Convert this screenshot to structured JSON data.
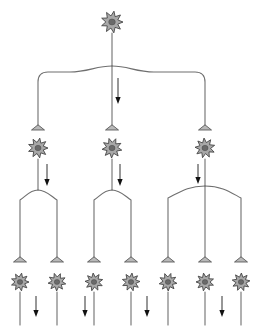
{
  "figure": {
    "background_color": "#ffffff",
    "canvas": {
      "width": 265,
      "height": 327
    }
  },
  "style": {
    "axon_color": "#6f6f6f",
    "soma_fill": "#a8a8a8",
    "soma_outline": "#3d3d3d",
    "nucleus_fill": "#6a6a6a",
    "terminal_fill": "#b9b9b9",
    "terminal_outline": "#4a4a4a",
    "flow_arrow_color": "#111111"
  },
  "layers": [
    {
      "name": "input-layer",
      "level": 1,
      "count": 1,
      "neurons": [
        {
          "id": "n1",
          "label": "input-neuron",
          "cx": 112,
          "cy": 22,
          "r": 11,
          "spikes": 9,
          "outputs": 3
        }
      ]
    },
    {
      "name": "relay-layer",
      "level": 2,
      "count": 3,
      "neurons": [
        {
          "id": "n2a",
          "label": "relay-neuron-left",
          "cx": 38,
          "cy": 148,
          "r": 10,
          "spikes": 9,
          "outputs": 2
        },
        {
          "id": "n2b",
          "label": "relay-neuron-middle",
          "cx": 112,
          "cy": 148,
          "r": 10,
          "spikes": 9,
          "outputs": 2
        },
        {
          "id": "n2c",
          "label": "relay-neuron-right",
          "cx": 205,
          "cy": 148,
          "r": 10,
          "spikes": 9,
          "outputs": 3
        }
      ]
    },
    {
      "name": "output-layer",
      "level": 3,
      "count": 7,
      "neurons": [
        {
          "id": "n3a",
          "label": "output-neuron-1",
          "cx": 20,
          "cy": 282,
          "r": 9,
          "spikes": 9
        },
        {
          "id": "n3b",
          "label": "output-neuron-2",
          "cx": 57,
          "cy": 282,
          "r": 9,
          "spikes": 9
        },
        {
          "id": "n3c",
          "label": "output-neuron-3",
          "cx": 94,
          "cy": 282,
          "r": 9,
          "spikes": 9
        },
        {
          "id": "n3d",
          "label": "output-neuron-4",
          "cx": 131,
          "cy": 282,
          "r": 9,
          "spikes": 9
        },
        {
          "id": "n3e",
          "label": "output-neuron-5",
          "cx": 168,
          "cy": 282,
          "r": 9,
          "spikes": 9
        },
        {
          "id": "n3f",
          "label": "output-neuron-6",
          "cx": 205,
          "cy": 282,
          "r": 9,
          "spikes": 9
        },
        {
          "id": "n3g",
          "label": "output-neuron-7",
          "cx": 241,
          "cy": 282,
          "r": 9,
          "spikes": 9
        }
      ]
    }
  ],
  "terminals": [
    {
      "id": "t2a",
      "label": "synapse-terminal-onto-relay-left",
      "x": 38,
      "y": 130
    },
    {
      "id": "t2b",
      "label": "synapse-terminal-onto-relay-middle",
      "x": 112,
      "y": 130
    },
    {
      "id": "t2c",
      "label": "synapse-terminal-onto-relay-right",
      "x": 205,
      "y": 130
    },
    {
      "id": "t3a",
      "label": "synapse-terminal-onto-output-1",
      "x": 20,
      "y": 262
    },
    {
      "id": "t3b",
      "label": "synapse-terminal-onto-output-2",
      "x": 57,
      "y": 262
    },
    {
      "id": "t3c",
      "label": "synapse-terminal-onto-output-3",
      "x": 94,
      "y": 262
    },
    {
      "id": "t3d",
      "label": "synapse-terminal-onto-output-4",
      "x": 131,
      "y": 262
    },
    {
      "id": "t3e",
      "label": "synapse-terminal-onto-output-5",
      "x": 168,
      "y": 262
    },
    {
      "id": "t3f",
      "label": "synapse-terminal-onto-output-6",
      "x": 205,
      "y": 262
    },
    {
      "id": "t3g",
      "label": "synapse-terminal-onto-output-7",
      "x": 241,
      "y": 262
    }
  ],
  "connections": [
    {
      "id": "c1",
      "label": "input-axon-trunk",
      "from": "n1",
      "to": "branch-1",
      "path": "M112,33 L112,66"
    },
    {
      "id": "c2",
      "label": "input-branch-to-relay-left",
      "from": "branch-1",
      "to": "t2a",
      "path": "M112,66 C 96,66 88,72 70,72 L 48,72 Q 38,72 38,82 L 38,128"
    },
    {
      "id": "c3",
      "label": "input-branch-to-relay-middle",
      "from": "branch-1",
      "to": "t2b",
      "path": "M112,66 L112,128"
    },
    {
      "id": "c4",
      "label": "input-branch-to-relay-right",
      "from": "branch-1",
      "to": "t2c",
      "path": "M112,66 C 128,66 136,72 154,72 L 195,72 Q 205,72 205,82 L 205,128"
    },
    {
      "id": "c5",
      "label": "relay-left-axon-trunk",
      "from": "n2a",
      "to": "branch-2a",
      "path": "M38,159 L38,190"
    },
    {
      "id": "c6",
      "label": "relay-left-branch-to-output-1",
      "from": "branch-2a",
      "to": "t3a",
      "path": "M38,190 C 30,190 26,196 20,200 L 20,260"
    },
    {
      "id": "c7",
      "label": "relay-left-branch-to-output-2",
      "from": "branch-2a",
      "to": "t3b",
      "path": "M38,190 C 46,190 51,196 57,200 L 57,260"
    },
    {
      "id": "c8",
      "label": "relay-middle-axon-trunk",
      "from": "n2b",
      "to": "branch-2b",
      "path": "M112,159 L112,190"
    },
    {
      "id": "c9",
      "label": "relay-middle-branch-to-output-3",
      "from": "branch-2b",
      "to": "t3c",
      "path": "M112,190 C 104,190 100,196 94,200 L 94,260"
    },
    {
      "id": "c10",
      "label": "relay-middle-branch-to-output-4",
      "from": "branch-2b",
      "to": "t3d",
      "path": "M112,190 C 120,190 125,196 131,200 L 131,260"
    },
    {
      "id": "c11",
      "label": "relay-right-axon-trunk",
      "from": "n2c",
      "to": "branch-2c",
      "path": "M205,159 L205,186"
    },
    {
      "id": "c12",
      "label": "relay-right-branch-to-output-5",
      "from": "branch-2c",
      "to": "t3e",
      "path": "M205,186 C 188,186 180,192 168,198 L 168,260"
    },
    {
      "id": "c13",
      "label": "relay-right-branch-to-output-6",
      "from": "branch-2c",
      "to": "t3f",
      "path": "M205,186 L205,260"
    },
    {
      "id": "c14",
      "label": "relay-right-branch-to-output-7",
      "from": "branch-2c",
      "to": "t3g",
      "path": "M205,186 C 222,186 230,192 241,198 L 241,260"
    },
    {
      "id": "c15",
      "label": "output-axon-1",
      "from": "n3a",
      "to": "",
      "path": "M20,292 L20,325"
    },
    {
      "id": "c16",
      "label": "output-axon-2",
      "from": "n3b",
      "to": "",
      "path": "M57,292 L57,325"
    },
    {
      "id": "c17",
      "label": "output-axon-3",
      "from": "n3c",
      "to": "",
      "path": "M94,292 L94,325"
    },
    {
      "id": "c18",
      "label": "output-axon-4",
      "from": "n3d",
      "to": "",
      "path": "M131,292 L131,325"
    },
    {
      "id": "c19",
      "label": "output-axon-5",
      "from": "n3e",
      "to": "",
      "path": "M168,292 L168,325"
    },
    {
      "id": "c20",
      "label": "output-axon-6",
      "from": "n3f",
      "to": "",
      "path": "M205,292 L205,325"
    },
    {
      "id": "c21",
      "label": "output-axon-7",
      "from": "n3g",
      "to": "",
      "path": "M241,292 L241,325"
    }
  ],
  "flow_arrows": [
    {
      "id": "f1",
      "label": "signal-flow-arrow-input",
      "x": 118,
      "y1": 78,
      "y2": 104
    },
    {
      "id": "f2",
      "label": "signal-flow-arrow-relay-left",
      "x": 47,
      "y1": 164,
      "y2": 186
    },
    {
      "id": "f3",
      "label": "signal-flow-arrow-relay-middle",
      "x": 120,
      "y1": 164,
      "y2": 186
    },
    {
      "id": "f4",
      "label": "signal-flow-arrow-relay-right",
      "x": 198,
      "y1": 164,
      "y2": 184
    },
    {
      "id": "f5",
      "label": "signal-flow-arrow-output-a",
      "x": 36,
      "y1": 296,
      "y2": 317
    },
    {
      "id": "f6",
      "label": "signal-flow-arrow-output-b",
      "x": 85,
      "y1": 296,
      "y2": 317
    },
    {
      "id": "f7",
      "label": "signal-flow-arrow-output-c",
      "x": 147,
      "y1": 296,
      "y2": 317
    },
    {
      "id": "f8",
      "label": "signal-flow-arrow-output-d",
      "x": 222,
      "y1": 296,
      "y2": 317
    }
  ]
}
